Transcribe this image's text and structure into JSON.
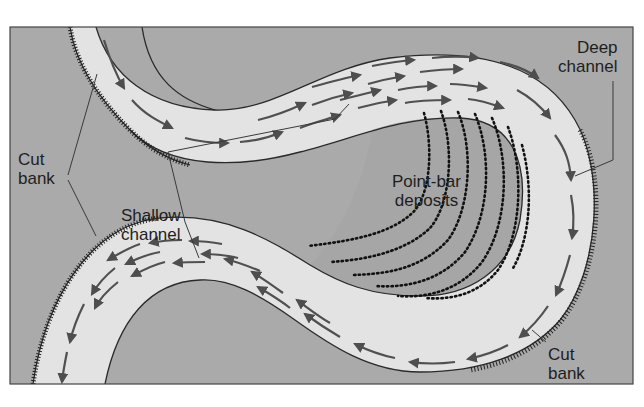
{
  "figure": {
    "colors": {
      "floodplain": "#a9a9a9",
      "channel": "#e3e3e3",
      "bank_line": "#2a2a2a",
      "flow_arrow": "#505050",
      "point_bar_dots": "#111111",
      "frame": "#444444"
    }
  },
  "labels": {
    "cut_bank_upper": {
      "line1": "Cut",
      "line2": "bank"
    },
    "deep_channel": {
      "line1": "Deep",
      "line2": "channel"
    },
    "shallow_channel": {
      "line1": "Shallow",
      "line2": "channel"
    },
    "point_bar": {
      "line1": "Point-bar",
      "line2": "deposits"
    },
    "cut_bank_lower": {
      "line1": "Cut",
      "line2": "bank"
    }
  },
  "features": [
    {
      "name": "cut-bank",
      "count": 2,
      "style": "hatched outer bank"
    },
    {
      "name": "point-bar-deposits",
      "style": "dotted accretion lines",
      "line_count": 7
    },
    {
      "name": "flow-arrows",
      "direction": "downstream along meander"
    }
  ]
}
